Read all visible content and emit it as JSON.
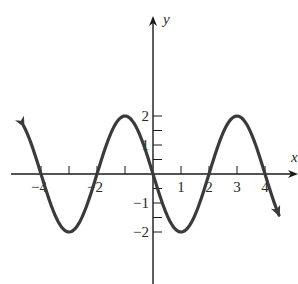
{
  "chart_data": {
    "type": "line",
    "title": "",
    "xlabel": "x",
    "ylabel": "y",
    "function": "y = -2 sin(pi x / 2)",
    "amplitude": 2,
    "period": 4,
    "xlim": [
      -5.4,
      5.2
    ],
    "ylim": [
      -2.15,
      2.8
    ],
    "grid": false,
    "legend": null,
    "x_tick_labels": [
      {
        "value": -4,
        "label": "-4"
      },
      {
        "value": -2,
        "label": "-2"
      },
      {
        "value": 1,
        "label": "1"
      },
      {
        "value": 2,
        "label": "2"
      },
      {
        "value": 3,
        "label": "3"
      },
      {
        "value": 4,
        "label": "4"
      }
    ],
    "x_ticks": [
      -4,
      -3,
      -2,
      -1,
      1,
      2,
      3,
      4
    ],
    "y_tick_labels": [
      {
        "value": 2,
        "label": "2"
      },
      {
        "value": 1,
        "label": "1"
      },
      {
        "value": -1,
        "label": "-1"
      },
      {
        "value": -2,
        "label": "-2"
      }
    ],
    "y_ticks": [
      2,
      1.5,
      1,
      0.5,
      -0.5,
      -1,
      -1.5,
      -2
    ],
    "series": [
      {
        "name": "y = -2 sin(πx/2)",
        "x_range": [
          -4.62,
          4.5
        ],
        "key_points": [
          {
            "x": -4,
            "y": 0
          },
          {
            "x": -3,
            "y": -2
          },
          {
            "x": -2,
            "y": 0
          },
          {
            "x": -1,
            "y": 2
          },
          {
            "x": 0,
            "y": 0
          },
          {
            "x": 1,
            "y": -2
          },
          {
            "x": 2,
            "y": 0
          },
          {
            "x": 3,
            "y": 2
          },
          {
            "x": 4,
            "y": 0
          }
        ],
        "arrows_at_ends": true,
        "color": "#3a3a3a"
      }
    ]
  },
  "colors": {
    "axis": "#1a1a1a",
    "curve": "#3a3a3a",
    "text": "#2a2a2a"
  },
  "labels": {
    "x_axis": "x",
    "y_axis": "y",
    "x_ticks": [
      "-4",
      "-2",
      "1",
      "2",
      "3",
      "4"
    ],
    "y_ticks": [
      "2",
      "1",
      "-1",
      "-2"
    ]
  }
}
